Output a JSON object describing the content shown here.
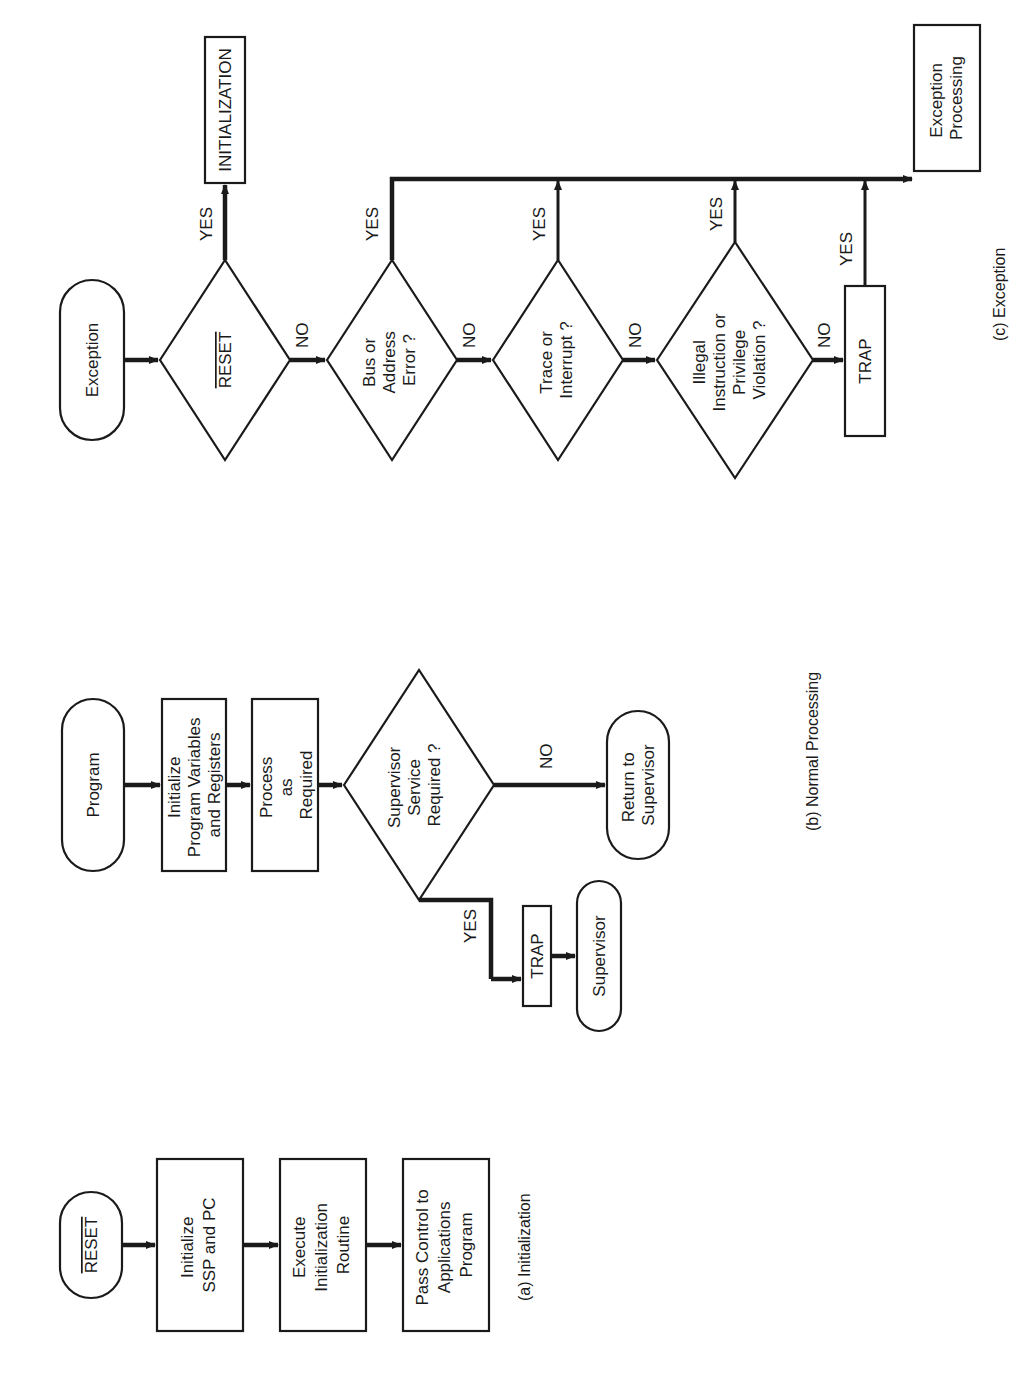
{
  "orientation": "rotated-90-ccw",
  "panels": {
    "a": {
      "caption": "(a)  Initialization",
      "start": "RESET",
      "steps": [
        [
          "Initialize",
          "SSP and PC"
        ],
        [
          "Execute",
          "Initialization",
          "Routine"
        ],
        [
          "Pass Control to",
          "Applications",
          "Program"
        ]
      ]
    },
    "b": {
      "caption": "(b)  Normal Processing",
      "start": "Program",
      "steps": [
        [
          "Initialize",
          "Program Variables",
          "and Registers"
        ],
        [
          "Process",
          "as",
          "Required"
        ]
      ],
      "decision": [
        "Supervisor",
        "Service",
        "Required ?"
      ],
      "no_label": "NO",
      "yes_label": "YES",
      "no_target": [
        "Return to",
        "Supervisor"
      ],
      "trap": "TRAP",
      "yes_target": "Supervisor"
    },
    "c": {
      "caption": "(c)  Exception",
      "start": "Exception",
      "decisions": [
        [
          "RESET"
        ],
        [
          "Bus or",
          "Address",
          "Error ?"
        ],
        [
          "Trace or",
          "Interrupt ?"
        ],
        [
          "Illegal",
          "Instruction or",
          "Privilege",
          "Violation ?"
        ]
      ],
      "no_label": "NO",
      "yes_label": "YES",
      "reset_target": "INITIALIZATION",
      "trap": "TRAP",
      "target": [
        "Exception",
        "Processing"
      ]
    }
  }
}
